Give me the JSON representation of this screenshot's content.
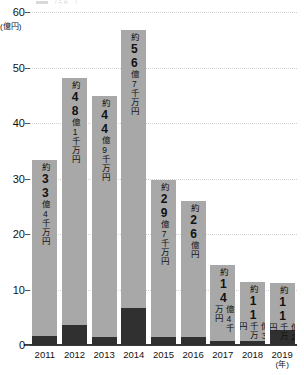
{
  "legend": {
    "sliver_text": "（うち…）"
  },
  "chart_data": {
    "type": "bar",
    "title": "",
    "xlabel": "(年)",
    "ylabel": "(億円)",
    "ylim": [
      0,
      60
    ],
    "yticks": [
      0,
      10,
      20,
      30,
      40,
      50,
      60
    ],
    "grid": true,
    "legend_position": "top",
    "categories": [
      "2011",
      "2012",
      "2013",
      "2014",
      "2015",
      "2016",
      "2017",
      "2018",
      "2019"
    ],
    "values": [
      33.4,
      48.1,
      44.9,
      56.7,
      29.7,
      26.0,
      14.4,
      11.3,
      11.2
    ],
    "series": [
      {
        "name": "total",
        "color": "#a8a8a8",
        "values": [
          33.4,
          48.1,
          44.9,
          56.7,
          29.7,
          26.0,
          14.4,
          11.3,
          11.2
        ]
      },
      {
        "name": "dark-segment",
        "color": "#303030",
        "values": [
          1.6,
          3.6,
          1.5,
          6.6,
          1.5,
          1.5,
          0.7,
          0.7,
          2.7
        ]
      }
    ],
    "data_labels": [
      {
        "year": "2011",
        "prefix": "約",
        "number": "33",
        "suffix": "億4千万円",
        "inside": true
      },
      {
        "year": "2012",
        "prefix": "約",
        "number": "48",
        "suffix": "億1千万円",
        "inside": true
      },
      {
        "year": "2013",
        "prefix": "約",
        "number": "44",
        "suffix": "億9千万円",
        "inside": true
      },
      {
        "year": "2014",
        "prefix": "約",
        "number": "56",
        "suffix": "億7千万円",
        "inside": true
      },
      {
        "year": "2015",
        "prefix": "約",
        "number": "29",
        "suffix": "億7千万円",
        "inside": true
      },
      {
        "year": "2016",
        "prefix": "約",
        "number": "26",
        "suffix": "億円",
        "inside": true
      },
      {
        "year": "2017",
        "prefix": "約",
        "number": "14",
        "suffix": "億4千万円",
        "inside": true
      },
      {
        "year": "2018",
        "prefix": "約",
        "number": "11",
        "suffix": "億3千万円",
        "inside": true
      },
      {
        "year": "2019",
        "prefix": "約",
        "number": "11",
        "suffix": "億2千万円",
        "inside": true
      }
    ],
    "ytick_labels": [
      "0",
      "10",
      "20",
      "30",
      "40",
      "50",
      "60"
    ]
  },
  "colors": {
    "bar_light": "#a8a8a8",
    "bar_dark": "#303030",
    "grid": "#dcdcdc",
    "axis": "#3a3a3a",
    "text": "#111111"
  }
}
